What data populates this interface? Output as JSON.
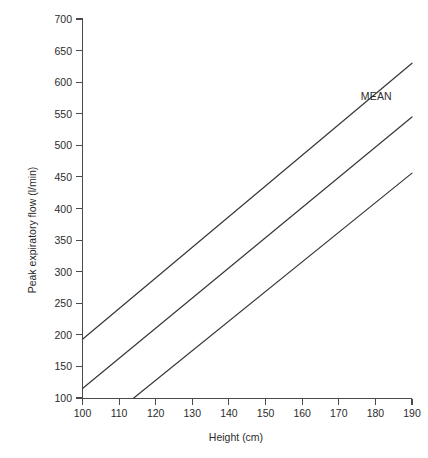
{
  "chart_data": {
    "type": "line",
    "title": "",
    "xlabel": "Height  (cm)",
    "ylabel": "Peak expiratory flow (l/min)",
    "xlim": [
      100,
      190
    ],
    "ylim": [
      100,
      700
    ],
    "xticks": [
      100,
      110,
      120,
      130,
      140,
      150,
      160,
      170,
      180,
      190
    ],
    "yticks": [
      100,
      150,
      200,
      250,
      300,
      350,
      400,
      450,
      500,
      550,
      600,
      650,
      700
    ],
    "xtick_labels": [
      "100",
      "110",
      "120",
      "130",
      "140",
      "150",
      "160",
      "170",
      "180",
      "190"
    ],
    "ytick_labels": [
      "100",
      "150",
      "200",
      "250",
      "300",
      "350",
      "400",
      "450",
      "500",
      "550",
      "600",
      "650",
      "700"
    ],
    "grid": false,
    "legend_position": "inline-annotation",
    "line_color": "#3a3a3a",
    "axis_color": "#4a4a4a",
    "series": [
      {
        "name": "upper-limit",
        "label": "",
        "x": [
          100,
          190
        ],
        "values": [
          193,
          630
        ]
      },
      {
        "name": "mean",
        "label": "MEAN",
        "x": [
          100,
          190
        ],
        "values": [
          115,
          545
        ],
        "annotation": {
          "text": "MEAN",
          "x": 176,
          "y": 572
        }
      },
      {
        "name": "lower-limit",
        "label": "",
        "x": [
          114,
          190
        ],
        "values": [
          100,
          456
        ]
      }
    ]
  }
}
